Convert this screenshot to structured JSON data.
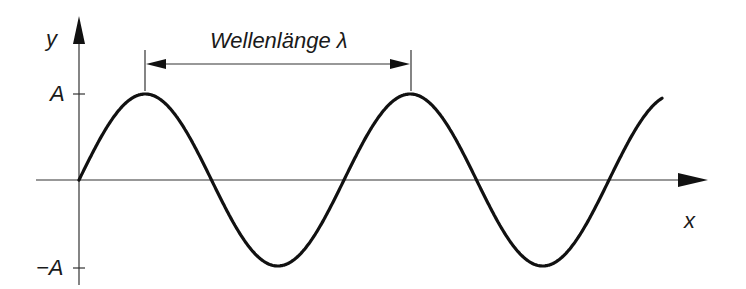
{
  "diagram": {
    "title_label": "Wellenlänge λ",
    "axes": {
      "x_label": "x",
      "y_label": "y",
      "y_ticks": [
        {
          "label": "A",
          "value": 1
        },
        {
          "label": "−A",
          "value": -1
        }
      ]
    },
    "wave": {
      "type": "sine",
      "amplitude_label": "A",
      "wavelength_label": "λ",
      "periods_shown": 2.2
    },
    "colors": {
      "stroke": "#111111",
      "axis": "#333333",
      "background": "#ffffff"
    }
  }
}
